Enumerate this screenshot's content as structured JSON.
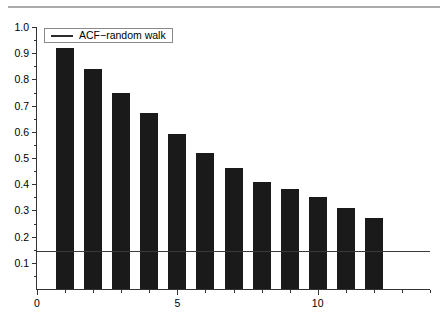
{
  "chart_data": {
    "type": "bar",
    "title": "",
    "subtitle": "",
    "xlabel": "",
    "ylabel": "",
    "categories": [
      1,
      2,
      3,
      4,
      5,
      6,
      7,
      8,
      9,
      10,
      11,
      12
    ],
    "values": [
      0.92,
      0.84,
      0.75,
      0.67,
      0.59,
      0.52,
      0.46,
      0.41,
      0.38,
      0.35,
      0.31,
      0.27
    ],
    "series": [
      {
        "name": "ACF−random walk",
        "values": [
          0.92,
          0.84,
          0.75,
          0.67,
          0.59,
          0.52,
          0.46,
          0.41,
          0.38,
          0.35,
          0.31,
          0.27
        ]
      }
    ],
    "xlim": [
      0,
      14
    ],
    "ylim": [
      0,
      1.0
    ],
    "x_ticks": [
      0,
      5,
      10
    ],
    "x_tick_labels": [
      "0",
      "5",
      "10"
    ],
    "x_minor_ticks": [
      1,
      2,
      3,
      4,
      6,
      7,
      8,
      9,
      11,
      12,
      13,
      14
    ],
    "y_ticks": [
      0.1,
      0.2,
      0.3,
      0.4,
      0.5,
      0.6,
      0.7,
      0.8,
      0.9,
      1.0
    ],
    "y_tick_labels": [
      "0.1",
      "0.2",
      "0.3",
      "0.4",
      "0.5",
      "0.6",
      "0.7",
      "0.8",
      "0.9",
      "1.0"
    ],
    "y_minor_ticks": [
      0.05,
      0.15,
      0.25,
      0.35,
      0.45,
      0.55,
      0.65,
      0.75,
      0.85,
      0.95
    ],
    "grid": false,
    "legend": {
      "position": "top-left",
      "entries": [
        {
          "label": "ACF−random walk",
          "marker": "line",
          "color": "#2b2b2b"
        }
      ]
    },
    "annotations": [
      {
        "type": "horizontal-reference-line",
        "value": 0.145,
        "color": "#3a3a3a",
        "label": ""
      }
    ],
    "bar_color": "#1a1a1a",
    "axis_color": "#333333",
    "background_color": "#ffffff",
    "top_rule_color": "#aaaaaa"
  }
}
